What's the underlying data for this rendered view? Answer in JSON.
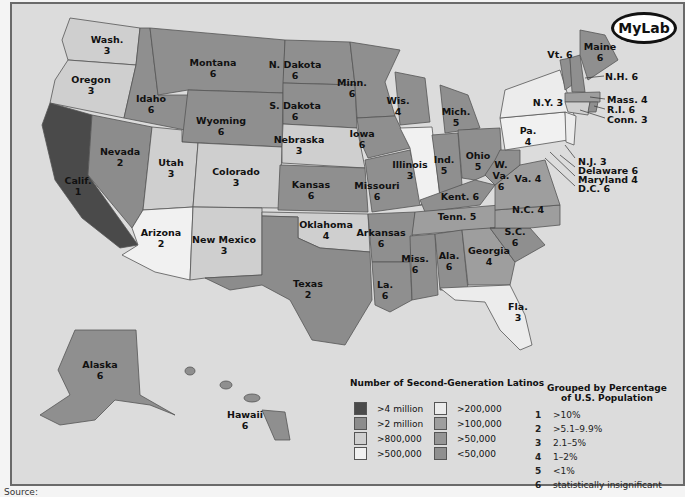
{
  "logo": {
    "text": "MyLab"
  },
  "colors": {
    "ocean": "#dcdcdc",
    "c_4m": "#4a4a4a",
    "c_2m": "#8c8c8c",
    "c_800k": "#cfcfcf",
    "c_500k": "#f1f1f1",
    "c_200k": "#ececec",
    "c_100k": "#9e9e9e",
    "c_50k": "#959595",
    "c_lt50k": "#8f8f8f"
  },
  "states": [
    {
      "name": "Wash.",
      "group": "3"
    },
    {
      "name": "Oregon",
      "group": "3"
    },
    {
      "name": "Calif.",
      "group": "1"
    },
    {
      "name": "Idaho",
      "group": "6"
    },
    {
      "name": "Nevada",
      "group": "2"
    },
    {
      "name": "Montana",
      "group": "6"
    },
    {
      "name": "Wyoming",
      "group": "6"
    },
    {
      "name": "Utah",
      "group": "3"
    },
    {
      "name": "Colorado",
      "group": "3"
    },
    {
      "name": "Arizona",
      "group": "2"
    },
    {
      "name": "New Mexico",
      "group": "3"
    },
    {
      "name": "N. Dakota",
      "group": "6"
    },
    {
      "name": "S. Dakota",
      "group": "6"
    },
    {
      "name": "Nebraska",
      "group": "3"
    },
    {
      "name": "Kansas",
      "group": "6"
    },
    {
      "name": "Oklahoma",
      "group": "4"
    },
    {
      "name": "Texas",
      "group": "2"
    },
    {
      "name": "Minn.",
      "group": "6"
    },
    {
      "name": "Iowa",
      "group": "6"
    },
    {
      "name": "Missouri",
      "group": "6"
    },
    {
      "name": "Arkansas",
      "group": "6"
    },
    {
      "name": "La.",
      "group": "6"
    },
    {
      "name": "Wis.",
      "group": "4"
    },
    {
      "name": "Illinois",
      "group": "3"
    },
    {
      "name": "Mich.",
      "group": "5"
    },
    {
      "name": "Ind.",
      "group": "5"
    },
    {
      "name": "Ohio",
      "group": "5"
    },
    {
      "name": "Kent.",
      "group": "6"
    },
    {
      "name": "Tenn.",
      "group": "5"
    },
    {
      "name": "Miss.",
      "group": "6"
    },
    {
      "name": "Ala.",
      "group": "6"
    },
    {
      "name": "Georgia",
      "group": "4"
    },
    {
      "name": "Fla.",
      "group": "3"
    },
    {
      "name": "S.C.",
      "group": "6"
    },
    {
      "name": "N.C.",
      "group": "4"
    },
    {
      "name": "Va.",
      "group": "4"
    },
    {
      "name": "W. Va.",
      "group": "6"
    },
    {
      "name": "Pa.",
      "group": "4"
    },
    {
      "name": "N.Y.",
      "group": "3"
    },
    {
      "name": "Vt.",
      "group": "6"
    },
    {
      "name": "Maine",
      "group": "6"
    },
    {
      "name": "N.H.",
      "group": "6"
    },
    {
      "name": "Mass.",
      "group": "4"
    },
    {
      "name": "R.I.",
      "group": "6"
    },
    {
      "name": "Conn.",
      "group": "3"
    },
    {
      "name": "N.J.",
      "group": "3"
    },
    {
      "name": "Delaware",
      "group": "6"
    },
    {
      "name": "Maryland",
      "group": "4"
    },
    {
      "name": "D.C.",
      "group": "6"
    },
    {
      "name": "Alaska",
      "group": "6"
    },
    {
      "name": "Hawaii",
      "group": "6"
    }
  ],
  "labels": {
    "wash": "Wash.\n3",
    "oregon": "Oregon\n3",
    "calif": "Calif.\n1",
    "idaho": "Idaho\n6",
    "nevada": "Nevada\n2",
    "montana": "Montana\n6",
    "wyoming": "Wyoming\n6",
    "utah": "Utah\n3",
    "colorado": "Colorado\n3",
    "arizona": "Arizona\n2",
    "newmexico": "New Mexico\n3",
    "ndakota": "N. Dakota\n6",
    "sdakota": "S. Dakota\n6",
    "nebraska": "Nebraska\n3",
    "kansas": "Kansas\n6",
    "oklahoma": "Oklahoma\n4",
    "texas": "Texas\n2",
    "minn": "Minn.\n6",
    "iowa": "Iowa\n6",
    "missouri": "Missouri\n6",
    "arkansas": "Arkansas\n6",
    "la": "La.\n6",
    "wis": "Wis.\n4",
    "illinois": "Illinois\n3",
    "mich": "Mich.\n5",
    "ind": "Ind.\n5",
    "ohio": "Ohio\n5",
    "kent": "Kent. 6",
    "tenn": "Tenn. 5",
    "miss": "Miss.\n6",
    "ala": "Ala.\n6",
    "georgia": "Georgia\n4",
    "fla": "Fla.\n3",
    "sc": "S.C.\n6",
    "nc": "N.C. 4",
    "va": "Va. 4",
    "wva": "W.\nVa.\n6",
    "pa": "Pa.\n4",
    "ny": "N.Y. 3",
    "vt": "Vt. 6",
    "maine": "Maine\n6",
    "nh": "N.H. 6",
    "mass": "Mass. 4",
    "ri": "R.I. 6",
    "conn": "Conn. 3",
    "nj": "N.J. 3",
    "delaware": "Delaware 6",
    "maryland": "Maryland 4",
    "dc": "D.C. 6",
    "alaska": "Alaska\n6",
    "hawaii": "Hawaii\n6"
  },
  "legend_count": {
    "title": "Number of Second-Generation Latinos",
    "items": [
      {
        "label": ">4 million"
      },
      {
        "label": ">2 million"
      },
      {
        "label": ">800,000"
      },
      {
        "label": ">500,000"
      },
      {
        "label": ">200,000"
      },
      {
        "label": ">100,000"
      },
      {
        "label": ">50,000"
      },
      {
        "label": "<50,000"
      }
    ]
  },
  "legend_group": {
    "title": "Grouped by Percentage\nof U.S. Population",
    "items": [
      {
        "num": "1",
        "label": ">10%"
      },
      {
        "num": "2",
        "label": ">5.1–9.9%"
      },
      {
        "num": "3",
        "label": "2.1–5%"
      },
      {
        "num": "4",
        "label": "1–2%"
      },
      {
        "num": "5",
        "label": "<1%"
      },
      {
        "num": "6",
        "label": "statistically insignificant"
      }
    ]
  },
  "source": "Source:"
}
